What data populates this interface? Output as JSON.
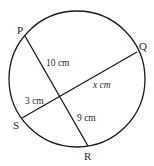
{
  "diagram": {
    "type": "intersecting-chords",
    "circle": {
      "cx": 77,
      "cy": 79,
      "r": 68
    },
    "stroke_color": "#1a1a1a",
    "points": {
      "P": {
        "label": "P",
        "x": 25,
        "y": 36
      },
      "Q": {
        "label": "Q",
        "x": 137,
        "y": 52
      },
      "S": {
        "label": "S",
        "x": 22,
        "y": 118
      },
      "R": {
        "label": "R",
        "x": 88,
        "y": 146
      }
    },
    "chords": [
      {
        "from": "P",
        "to": "R"
      },
      {
        "from": "S",
        "to": "Q"
      }
    ],
    "intersection": {
      "x": 61,
      "y": 97
    },
    "segment_labels": {
      "PX": "10 cm",
      "XQ": "x cm",
      "SX": "3 cm",
      "XR": "9 cm"
    }
  }
}
